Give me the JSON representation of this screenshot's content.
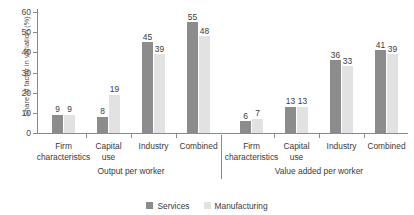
{
  "chart_data": {
    "type": "bar",
    "title": "",
    "xlabel": "",
    "ylabel": "Share of factor in variation (%)",
    "ylim": [
      0,
      60
    ],
    "yticks": [
      0,
      10,
      20,
      30,
      40,
      50,
      60
    ],
    "grid": false,
    "legend_position": "bottom-center",
    "panels": [
      {
        "name": "Output per worker",
        "categories": [
          "Firm characteristics",
          "Capital use",
          "Industry",
          "Combined"
        ],
        "series": [
          {
            "name": "Services",
            "values": [
              9,
              8,
              45,
              55
            ]
          },
          {
            "name": "Manufacturing",
            "values": [
              9,
              19,
              39,
              48
            ]
          }
        ]
      },
      {
        "name": "Value added per worker",
        "categories": [
          "Firm characteristics",
          "Capital use",
          "Industry",
          "Combined"
        ],
        "series": [
          {
            "name": "Services",
            "values": [
              6,
              13,
              36,
              41
            ]
          },
          {
            "name": "Manufacturing",
            "values": [
              7,
              13,
              33,
              39
            ]
          }
        ]
      }
    ],
    "series_colors": {
      "Services": "#8c8c8c",
      "Manufacturing": "#e2e2e2"
    }
  },
  "axis": {
    "y_label": "Share of factor in variation (%)",
    "y_tick_labels": [
      "0",
      "10",
      "20",
      "30",
      "40",
      "50",
      "60"
    ]
  },
  "panels": [
    {
      "title": "Output per worker",
      "categories": [
        {
          "line1": "Firm",
          "line2": "characteristics"
        },
        {
          "line1": "Capital",
          "line2": "use"
        },
        {
          "line1": "Industry",
          "line2": ""
        },
        {
          "line1": "Combined",
          "line2": ""
        }
      ],
      "bars": [
        {
          "services": "9",
          "manufacturing": "9"
        },
        {
          "services": "8",
          "manufacturing": "19"
        },
        {
          "services": "45",
          "manufacturing": "39"
        },
        {
          "services": "55",
          "manufacturing": "48"
        }
      ]
    },
    {
      "title": "Value added per worker",
      "categories": [
        {
          "line1": "Firm",
          "line2": "characteristics"
        },
        {
          "line1": "Capital",
          "line2": "use"
        },
        {
          "line1": "Industry",
          "line2": ""
        },
        {
          "line1": "Combined",
          "line2": ""
        }
      ],
      "bars": [
        {
          "services": "6",
          "manufacturing": "7"
        },
        {
          "services": "13",
          "manufacturing": "13"
        },
        {
          "services": "36",
          "manufacturing": "33"
        },
        {
          "services": "41",
          "manufacturing": "39"
        }
      ]
    }
  ],
  "legend": {
    "items": [
      {
        "label": "Services",
        "color": "#8c8c8c"
      },
      {
        "label": "Manufacturing",
        "color": "#e2e2e2"
      }
    ]
  },
  "colors": {
    "services": "#8c8c8c",
    "manufacturing": "#e2e2e2",
    "axis": "#8a8a8a",
    "text": "#3a3a3a",
    "background": "#ffffff"
  }
}
